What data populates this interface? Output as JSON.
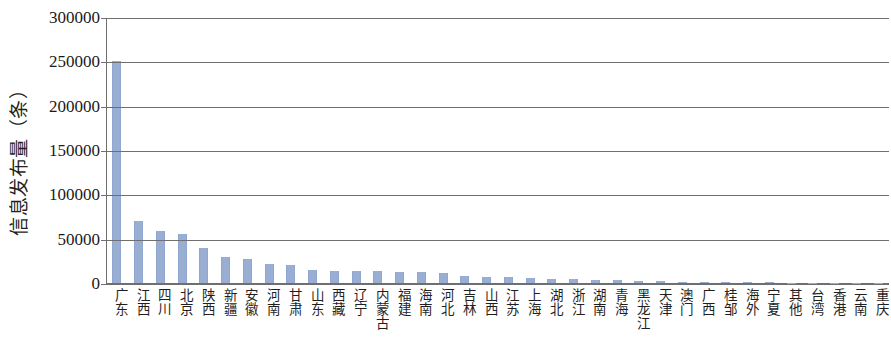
{
  "chart_data": {
    "type": "bar",
    "title": "",
    "xlabel": "",
    "ylabel": "信息发布量（条）",
    "ylim": [
      0,
      300000
    ],
    "y_ticks": [
      0,
      50000,
      100000,
      150000,
      200000,
      250000,
      300000
    ],
    "y_tick_labels": [
      "0",
      "50000",
      "100000",
      "150000",
      "200000",
      "250000",
      "300000"
    ],
    "grid": true,
    "legend": "none",
    "bar_color": "#9aaed3",
    "axis_color": "#6f6f6f",
    "categories": [
      "广东",
      "江西",
      "四川",
      "北京",
      "陕西",
      "新疆",
      "安徽",
      "河南",
      "甘肃",
      "山东",
      "西藏",
      "辽宁",
      "内蒙古",
      "福建",
      "海南",
      "河北",
      "吉林",
      "山西",
      "江苏",
      "上海",
      "湖北",
      "浙江",
      "湖南",
      "青海",
      "黑龙江",
      "天津",
      "澳门",
      "广西",
      "桂邹",
      "海外",
      "宁夏",
      "其他",
      "台湾",
      "香港",
      "云南",
      "重庆"
    ],
    "values": [
      250000,
      70000,
      59000,
      55000,
      39000,
      29000,
      27000,
      21000,
      20000,
      15000,
      14000,
      13500,
      13000,
      12500,
      12000,
      11500,
      8000,
      7000,
      6500,
      6000,
      5000,
      4200,
      3600,
      3000,
      2400,
      1900,
      1500,
      1200,
      1000,
      800,
      650,
      520,
      420,
      340,
      260,
      200
    ]
  },
  "axis": {
    "y_title": "信息发布量（条）"
  }
}
